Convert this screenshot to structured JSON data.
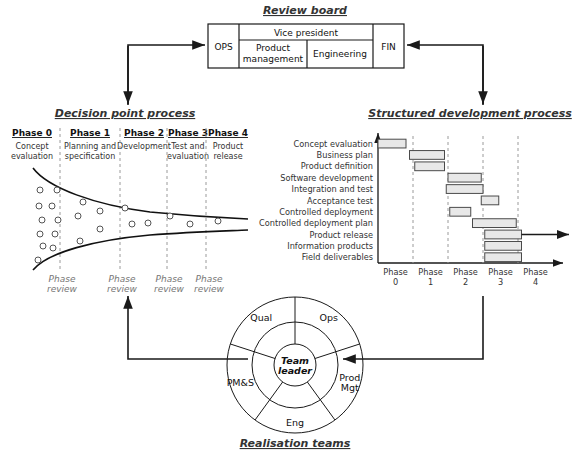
{
  "diagram": {
    "sections": {
      "review_board": {
        "title": "Review board",
        "cells": {
          "ops": "OPS",
          "vice_president": "Vice president",
          "product_management": "Product management",
          "engineering": "Engineering",
          "fin": "FIN"
        }
      },
      "decision_point_process": {
        "title": "Decision point process",
        "phases": [
          {
            "heading": "Phase 0",
            "sub_line1": "Concept",
            "sub_line2": "evaluation"
          },
          {
            "heading": "Phase 1",
            "sub_line1": "Planning and",
            "sub_line2": "specification"
          },
          {
            "heading": "Phase 2",
            "sub_line1": "Development",
            "sub_line2": ""
          },
          {
            "heading": "Phase 3",
            "sub_line1": "Test and",
            "sub_line2": "evaluation"
          },
          {
            "heading": "Phase 4",
            "sub_line1": "Product",
            "sub_line2": "release"
          }
        ],
        "review_markers": [
          {
            "line1": "Phase",
            "line2": "review"
          },
          {
            "line1": "Phase",
            "line2": "review"
          },
          {
            "line1": "Phase",
            "line2": "review"
          },
          {
            "line1": "Phase",
            "line2": "review"
          }
        ]
      },
      "structured_development_process": {
        "title": "Structured development process"
      },
      "realisation_teams": {
        "title": "Realisation teams",
        "center": {
          "line1": "Team",
          "line2": "leader"
        },
        "segments": [
          {
            "label_line1": "Ops",
            "label_line2": ""
          },
          {
            "label_line1": "Prod",
            "label_line2": "Mgt"
          },
          {
            "label_line1": "Eng",
            "label_line2": ""
          },
          {
            "label_line1": "PM&S",
            "label_line2": ""
          },
          {
            "label_line1": "Qual",
            "label_line2": ""
          }
        ]
      }
    },
    "colors": {
      "bar_fill": "#e8e8e8",
      "bar_stroke": "#4a4a4a",
      "line": "#1a1a1a",
      "dashed_gridline": "#9a9a9a",
      "muted_text": "#777777",
      "background": "#ffffff"
    }
  },
  "chart_data": {
    "type": "bar",
    "title": "Structured development process",
    "orientation": "horizontal",
    "xlabel": "",
    "ylabel": "",
    "grid": true,
    "legend": null,
    "x_axis": {
      "tick_labels": [
        "Phase 0",
        "Phase 1",
        "Phase 2",
        "Phase 3",
        "Phase 4"
      ],
      "tick_line1": [
        "Phase",
        "Phase",
        "Phase",
        "Phase",
        "Phase"
      ],
      "tick_line2": [
        "0",
        "1",
        "2",
        "3",
        "4"
      ],
      "range": [
        0,
        5
      ]
    },
    "categories": [
      "Concept evaluation",
      "Business plan",
      "Product definition",
      "Software development",
      "Integration and test",
      "Acceptance test",
      "Controlled deployment",
      "Controlled deployment plan",
      "Product release",
      "Information products",
      "Field deliverables"
    ],
    "series": [
      {
        "name": "Activity duration",
        "bars": [
          {
            "task": "Concept evaluation",
            "start": 0.0,
            "end": 0.8
          },
          {
            "task": "Business plan",
            "start": 0.9,
            "end": 1.9
          },
          {
            "task": "Product definition",
            "start": 1.05,
            "end": 1.9
          },
          {
            "task": "Software development",
            "start": 2.0,
            "end": 2.95
          },
          {
            "task": "Integration and test",
            "start": 1.95,
            "end": 3.0
          },
          {
            "task": "Acceptance test",
            "start": 2.95,
            "end": 3.45
          },
          {
            "task": "Controlled deployment",
            "start": 2.05,
            "end": 2.65
          },
          {
            "task": "Controlled deployment plan",
            "start": 2.7,
            "end": 3.95
          },
          {
            "task": "Product release",
            "start": 3.05,
            "end": 4.1
          },
          {
            "task": "Information products",
            "start": 3.05,
            "end": 4.1
          },
          {
            "task": "Field deliverables",
            "start": 3.05,
            "end": 4.1
          }
        ]
      }
    ],
    "annotations": [
      {
        "type": "arrow",
        "from_task": "Product release",
        "direction": "right",
        "note": "continues beyond Phase 4"
      }
    ]
  }
}
